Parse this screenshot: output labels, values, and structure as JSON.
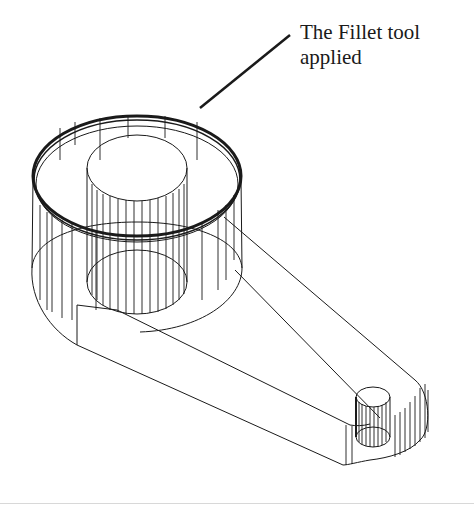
{
  "figure": {
    "type": "isometric wireframe drawing",
    "callout": {
      "line1": "The Fillet tool",
      "line2": "applied"
    },
    "colors": {
      "background": "#ffffff",
      "line": "#1a1a1a",
      "text": "#1a1a1a"
    }
  }
}
